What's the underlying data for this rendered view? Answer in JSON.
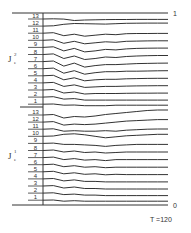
{
  "chart_data": {
    "type": "line",
    "title": "",
    "caption": "T =120",
    "xlabel": "",
    "ylabel": "",
    "top_value_label": "1",
    "bottom_value_label": "0",
    "grid": false,
    "groups": [
      {
        "name": "J_e^2",
        "label_main": "J",
        "label_sup": "2",
        "label_sub": "e",
        "series_labels": [
          "13",
          "12",
          "11",
          "10",
          "9",
          "8",
          "7",
          "6",
          "5",
          "4",
          "3",
          "2",
          "1"
        ],
        "series": [
          {
            "name": "13",
            "values": [
              0.0,
              0.2,
              -0.1,
              -1.5,
              -1.0,
              -0.8,
              -0.6,
              -0.5,
              -0.5,
              -0.4,
              -0.4,
              -0.4,
              -0.4
            ]
          },
          {
            "name": "12",
            "values": [
              0.0,
              0.3,
              1.8,
              2.6,
              2.4,
              2.2,
              2.0,
              2.4,
              2.8,
              2.9,
              3.0,
              3.0,
              3.0
            ]
          },
          {
            "name": "11",
            "values": [
              0.0,
              0.5,
              -2.5,
              -1.0,
              -3.0,
              -2.0,
              -1.0,
              -1.5,
              -0.5,
              -0.3,
              -0.3,
              -0.2,
              -0.2
            ]
          },
          {
            "name": "10",
            "values": [
              0.0,
              0.5,
              -3.0,
              -1.0,
              -3.5,
              -2.5,
              -1.5,
              -2.0,
              -1.0,
              -0.8,
              -0.6,
              -0.5,
              -0.5
            ]
          },
          {
            "name": "9",
            "values": [
              0.0,
              0.6,
              -3.5,
              -1.0,
              -4.5,
              -3.5,
              -2.0,
              -2.5,
              -1.5,
              -1.0,
              -0.8,
              -0.7,
              -0.7
            ]
          },
          {
            "name": "8",
            "values": [
              0.0,
              0.6,
              -4.0,
              -1.5,
              -5.0,
              -4.0,
              -2.5,
              -3.0,
              -2.0,
              -1.5,
              -1.2,
              -1.0,
              -1.0
            ]
          },
          {
            "name": "7",
            "values": [
              0.0,
              0.6,
              -4.5,
              -1.5,
              -5.5,
              -4.0,
              -3.0,
              -3.0,
              -2.5,
              -2.0,
              -1.8,
              -1.6,
              -1.5
            ]
          },
          {
            "name": "6",
            "values": [
              0.0,
              0.6,
              -4.5,
              -2.0,
              -5.5,
              -4.0,
              -3.0,
              -3.0,
              -2.5,
              -2.5,
              -2.3,
              -2.1,
              -2.0
            ]
          },
          {
            "name": "5",
            "values": [
              0.0,
              0.5,
              -4.0,
              -2.0,
              -5.0,
              -4.0,
              -3.5,
              -3.5,
              -3.0,
              -2.8,
              -2.6,
              -2.5,
              -2.5
            ]
          },
          {
            "name": "4",
            "values": [
              0.0,
              0.5,
              -3.5,
              -2.0,
              -4.5,
              -4.0,
              -3.5,
              -3.5,
              -3.2,
              -3.0,
              -2.9,
              -2.8,
              -2.8
            ]
          },
          {
            "name": "3",
            "values": [
              0.0,
              0.5,
              -3.0,
              -2.0,
              -4.0,
              -3.5,
              -3.5,
              -3.5,
              -3.3,
              -3.2,
              -3.2,
              -3.1,
              -3.1
            ]
          },
          {
            "name": "2",
            "values": [
              0.0,
              0.4,
              -2.0,
              -1.5,
              -3.0,
              -3.0,
              -3.0,
              -3.0,
              -3.0,
              -3.0,
              -3.0,
              -3.0,
              -3.0
            ]
          },
          {
            "name": "1",
            "values": [
              0.0,
              0.2,
              -1.0,
              -0.8,
              -1.5,
              -1.5,
              -1.5,
              -1.0,
              -1.0,
              -1.0,
              -1.0,
              -1.0,
              -1.0
            ]
          }
        ]
      },
      {
        "name": "J_e^1",
        "label_main": "J",
        "label_sup": "1",
        "label_sub": "e",
        "series_labels": [
          "13",
          "12",
          "11",
          "10",
          "9",
          "8",
          "7",
          "6",
          "5",
          "4",
          "3",
          "2",
          "1"
        ],
        "series": [
          {
            "name": "13",
            "values": [
              0.0,
              0.5,
              -3.0,
              -1.5,
              -2.0,
              -1.0,
              0.5,
              1.5,
              2.5,
              3.5,
              4.5,
              5.0,
              5.0
            ]
          },
          {
            "name": "12",
            "values": [
              0.0,
              0.5,
              -3.0,
              -2.0,
              -2.5,
              -2.0,
              -1.0,
              0.0,
              1.0,
              1.5,
              2.0,
              2.5,
              2.5
            ]
          },
          {
            "name": "11",
            "values": [
              0.0,
              0.4,
              -2.0,
              -1.5,
              -2.0,
              -2.0,
              -1.5,
              -2.0,
              -1.0,
              -0.5,
              0.0,
              0.2,
              0.2
            ]
          },
          {
            "name": "10",
            "values": [
              0.0,
              0.3,
              2.0,
              2.5,
              1.5,
              0.0,
              -1.5,
              -0.5,
              0.5,
              1.0,
              1.5,
              2.0,
              2.0
            ]
          },
          {
            "name": "9",
            "values": [
              0.0,
              0.3,
              -1.0,
              -1.0,
              -1.5,
              -2.0,
              -3.0,
              -2.0,
              -1.5,
              -1.0,
              -1.0,
              -1.0,
              -1.0
            ]
          },
          {
            "name": "8",
            "values": [
              0.0,
              0.5,
              -1.5,
              -0.5,
              -2.0,
              -1.5,
              -2.5,
              -2.0,
              -1.5,
              -1.5,
              -1.5,
              -1.5,
              -1.5
            ]
          },
          {
            "name": "7",
            "values": [
              0.0,
              0.5,
              -2.0,
              -1.0,
              -2.5,
              -2.0,
              -3.0,
              -2.0,
              -2.0,
              -2.0,
              -2.0,
              -2.0,
              -2.0
            ]
          },
          {
            "name": "6",
            "values": [
              0.0,
              0.5,
              -2.0,
              -1.0,
              -2.5,
              -2.0,
              -3.0,
              -2.5,
              -2.5,
              -2.5,
              -2.5,
              -2.5,
              -2.5
            ]
          },
          {
            "name": "5",
            "values": [
              0.0,
              0.5,
              -2.0,
              -1.0,
              -2.5,
              -2.0,
              -3.0,
              -2.5,
              -2.8,
              -2.8,
              -2.8,
              -2.8,
              -2.8
            ]
          },
          {
            "name": "4",
            "values": [
              0.0,
              0.4,
              -2.0,
              -1.0,
              -2.5,
              -2.5,
              -3.0,
              -3.0,
              -3.0,
              -3.0,
              -3.0,
              -3.0,
              -3.0
            ]
          },
          {
            "name": "3",
            "values": [
              0.0,
              0.4,
              -2.0,
              -1.0,
              -2.5,
              -2.5,
              -3.0,
              -3.0,
              -3.0,
              -3.0,
              -3.0,
              -3.0,
              -3.0
            ]
          },
          {
            "name": "2",
            "values": [
              0.0,
              0.3,
              -1.5,
              -1.0,
              -2.0,
              -2.0,
              -2.5,
              -2.5,
              -2.5,
              -2.5,
              -2.5,
              -2.5,
              -2.5
            ]
          },
          {
            "name": "1",
            "values": [
              0.0,
              0.2,
              -1.0,
              -0.5,
              -1.0,
              -1.0,
              -1.0,
              -1.0,
              -1.0,
              -1.0,
              -1.0,
              -1.0,
              -1.0
            ]
          }
        ]
      }
    ]
  }
}
